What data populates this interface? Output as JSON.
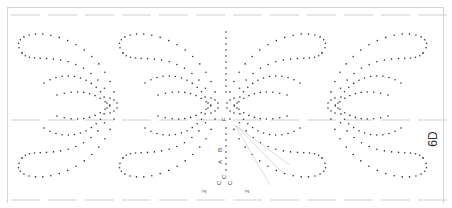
{
  "sheet": {
    "code": "6D",
    "letters": [
      {
        "t": "F",
        "x": 226,
        "y": 121,
        "r": -90
      },
      {
        "t": "B",
        "x": 222,
        "y": 152,
        "r": -90
      },
      {
        "t": "A",
        "x": 222,
        "y": 164,
        "r": -90
      },
      {
        "t": "C",
        "x": 226,
        "y": 179,
        "r": -90
      },
      {
        "t": "C",
        "x": 221,
        "y": 185,
        "r": -90
      },
      {
        "t": "C",
        "x": 232,
        "y": 185,
        "r": -90
      },
      {
        "t": "2",
        "x": 206,
        "y": 193,
        "r": -90
      },
      {
        "t": "2",
        "x": 249,
        "y": 193,
        "r": -90
      }
    ],
    "colors": {
      "dot": "#333333",
      "guide": "#cfcfcf",
      "frame": "#d6d6d6"
    }
  }
}
